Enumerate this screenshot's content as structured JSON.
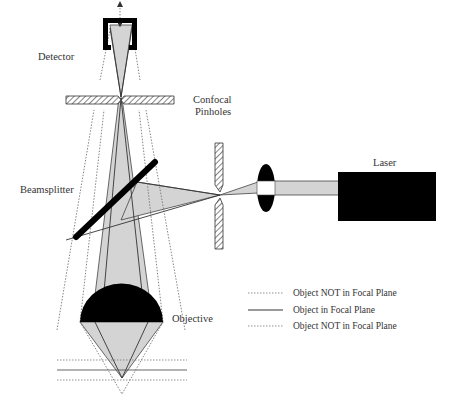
{
  "diagram": {
    "labels": {
      "detector": "Detector",
      "confocal_line1": "Confocal",
      "confocal_line2": "Pinholes",
      "laser": "Laser",
      "beamsplitter": "Beamsplitter",
      "objective": "Objective"
    },
    "legend": [
      {
        "style": "dotted",
        "label": "Object NOT in Focal Plane"
      },
      {
        "style": "solid",
        "label": "Object in Focal Plane"
      },
      {
        "style": "dotted",
        "label": "Object NOT in Focal Plane"
      }
    ],
    "colors": {
      "beam_fill": "#d4d4d4",
      "solid_black": "#000000",
      "line": "#444444",
      "dotted": "#777777",
      "text": "#333333"
    }
  }
}
